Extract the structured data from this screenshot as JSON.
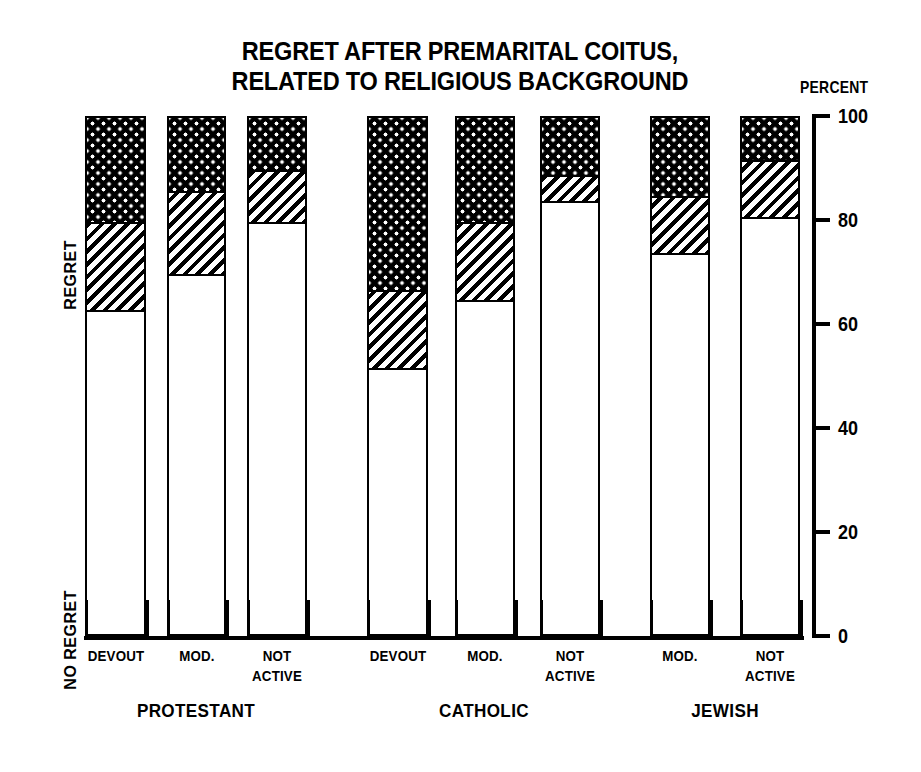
{
  "title": {
    "line1": "REGRET AFTER PREMARITAL COITUS,",
    "line2": "RELATED TO RELIGIOUS BACKGROUND"
  },
  "axis": {
    "caption": "PERCENT",
    "ticks": [
      "100",
      "80",
      "60",
      "40",
      "20",
      "0"
    ]
  },
  "side_labels": {
    "regret": "REGRET",
    "no_regret": "NO REGRET"
  },
  "chart_data": {
    "type": "bar",
    "subtype": "stacked-bar",
    "title": "REGRET AFTER PREMARITAL COITUS, RELATED TO RELIGIOUS BACKGROUND",
    "xlabel": "",
    "ylabel": "PERCENT",
    "ylim": [
      0,
      100
    ],
    "yticks": [
      0,
      20,
      40,
      60,
      80,
      100
    ],
    "grid": false,
    "legend_position": "none",
    "series": [
      {
        "name": "NO REGRET",
        "pattern": "white",
        "values": [
          63,
          70,
          80,
          52,
          65,
          84,
          74,
          81
        ]
      },
      {
        "name": "SOME REGRET",
        "pattern": "diagonal-hatch",
        "values": [
          17,
          16,
          10,
          15,
          15,
          5,
          11,
          11
        ]
      },
      {
        "name": "REGRET",
        "pattern": "checkered-dots",
        "values": [
          20,
          14,
          10,
          33,
          20,
          11,
          15,
          8
        ]
      }
    ],
    "groups": [
      {
        "label": "PROTESTANT",
        "categories": [
          {
            "label_line1": "DEVOUT",
            "label_line2": ""
          },
          {
            "label_line1": "MOD.",
            "label_line2": ""
          },
          {
            "label_line1": "NOT",
            "label_line2": "ACTIVE"
          }
        ]
      },
      {
        "label": "CATHOLIC",
        "categories": [
          {
            "label_line1": "DEVOUT",
            "label_line2": ""
          },
          {
            "label_line1": "MOD.",
            "label_line2": ""
          },
          {
            "label_line1": "NOT",
            "label_line2": "ACTIVE"
          }
        ]
      },
      {
        "label": "JEWISH",
        "categories": [
          {
            "label_line1": "MOD.",
            "label_line2": ""
          },
          {
            "label_line1": "NOT",
            "label_line2": "ACTIVE"
          }
        ]
      }
    ],
    "bars": [
      {
        "group": "PROTESTANT",
        "category": "DEVOUT",
        "no_regret": 63,
        "some_regret": 17,
        "regret": 20,
        "x": 85,
        "w": 61
      },
      {
        "group": "PROTESTANT",
        "category": "MOD.",
        "no_regret": 70,
        "some_regret": 16,
        "regret": 14,
        "x": 167,
        "w": 59
      },
      {
        "group": "PROTESTANT",
        "category": "NOT ACTIVE",
        "no_regret": 80,
        "some_regret": 10,
        "regret": 10,
        "x": 247,
        "w": 60
      },
      {
        "group": "CATHOLIC",
        "category": "DEVOUT",
        "no_regret": 52,
        "some_regret": 15,
        "regret": 33,
        "x": 367,
        "w": 61
      },
      {
        "group": "CATHOLIC",
        "category": "MOD.",
        "no_regret": 65,
        "some_regret": 15,
        "regret": 20,
        "x": 455,
        "w": 60
      },
      {
        "group": "CATHOLIC",
        "category": "NOT ACTIVE",
        "no_regret": 84,
        "some_regret": 5,
        "regret": 11,
        "x": 540,
        "w": 60
      },
      {
        "group": "JEWISH",
        "category": "MOD.",
        "no_regret": 74,
        "some_regret": 11,
        "regret": 15,
        "x": 650,
        "w": 60
      },
      {
        "group": "JEWISH",
        "category": "NOT ACTIVE",
        "no_regret": 81,
        "some_regret": 11,
        "regret": 8,
        "x": 740,
        "w": 60
      }
    ]
  }
}
